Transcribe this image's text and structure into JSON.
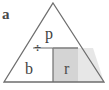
{
  "figure": {
    "type": "geometry-diagram",
    "colors": {
      "background": "#ffffff",
      "stroke": "#6e6e6e",
      "shaded_fill": "#d4d4d4",
      "label_text": "#3f3f3f"
    },
    "shapes": {
      "triangle": {
        "name": "outer-triangle",
        "apex": {
          "x": 53,
          "y": 3
        },
        "base_left": {
          "x": 4,
          "y": 82
        },
        "base_right": {
          "x": 104,
          "y": 82
        }
      },
      "horizontal_line": {
        "name": "horizontal-divider",
        "from": {
          "x": 33,
          "y": 48
        },
        "to": {
          "x": 78,
          "y": 48
        }
      },
      "vertical_line": {
        "name": "vertical-divider",
        "from": {
          "x": 53,
          "y": 48
        },
        "to": {
          "x": 53,
          "y": 82
        }
      },
      "shaded_rectangle": {
        "name": "shaded-region",
        "left": 53,
        "top": 48,
        "right": 78,
        "bottom": 82,
        "fill": "#d4d4d4"
      }
    },
    "labels": {
      "a": "a",
      "p": "p",
      "b": "b",
      "r": "r",
      "division_symbol": "÷"
    }
  }
}
